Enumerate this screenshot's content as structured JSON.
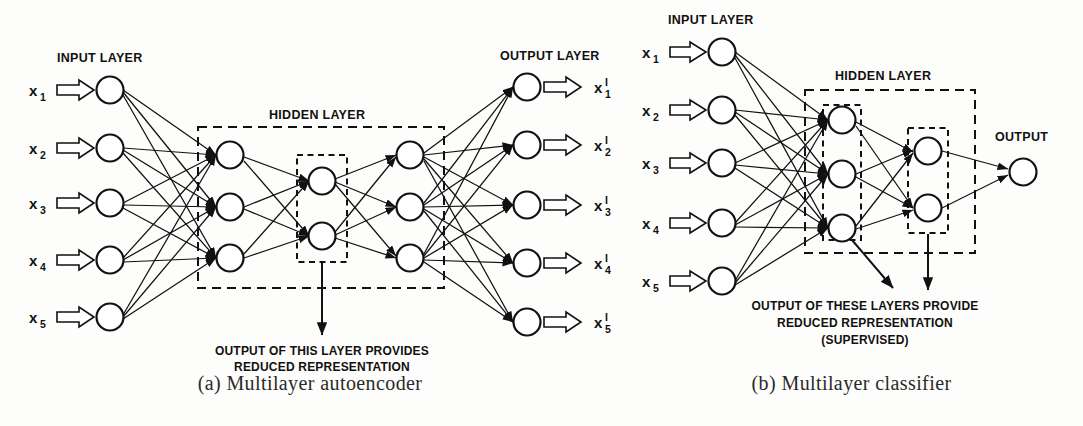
{
  "figure": {
    "panels": [
      {
        "id": "a",
        "caption": "(a) Multilayer autoencoder",
        "input_layer_label": "INPUT LAYER",
        "hidden_layer_label": "HIDDEN LAYER",
        "output_layer_label": "OUTPUT LAYER",
        "annotation_lines": [
          "OUTPUT OF THIS LAYER PROVIDES",
          "REDUCED REPRESENTATION"
        ],
        "input_labels": [
          "x",
          "x",
          "x",
          "x",
          "x"
        ],
        "input_subscripts": [
          "1",
          "2",
          "3",
          "4",
          "5"
        ],
        "output_labels": [
          "x",
          "x",
          "x",
          "x",
          "x"
        ],
        "output_superscripts": [
          "I",
          "I",
          "I",
          "I",
          "I"
        ],
        "output_subscripts": [
          "1",
          "2",
          "3",
          "4",
          "5"
        ],
        "layer_sizes": [
          5,
          3,
          2,
          3,
          5
        ],
        "layer_names": [
          "input",
          "encoder-hidden",
          "bottleneck",
          "decoder-hidden",
          "output"
        ]
      },
      {
        "id": "b",
        "caption": "(b) Multilayer classifier",
        "input_layer_label": "INPUT LAYER",
        "hidden_layer_label": "HIDDEN LAYER",
        "output_label": "OUTPUT",
        "annotation_lines": [
          "OUTPUT OF THESE LAYERS PROVIDE",
          "REDUCED REPRESENTATION",
          "(SUPERVISED)"
        ],
        "input_labels": [
          "x",
          "x",
          "x",
          "x",
          "x"
        ],
        "input_subscripts": [
          "1",
          "2",
          "3",
          "4",
          "5"
        ],
        "layer_sizes": [
          5,
          3,
          2,
          1
        ],
        "layer_names": [
          "input",
          "hidden-1",
          "hidden-2",
          "output"
        ]
      }
    ],
    "colors": {
      "ink": "#111111",
      "node_fill": "#ffffff",
      "background": "#fdfdfb",
      "caption": "#2a2a2a"
    }
  }
}
